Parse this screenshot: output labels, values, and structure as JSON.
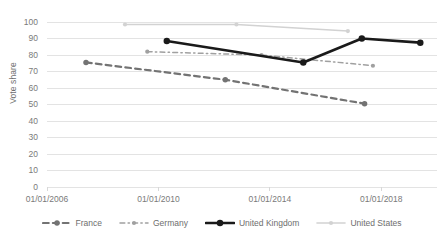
{
  "chart_data": {
    "type": "line",
    "title": "",
    "subtitle": "",
    "xlabel": "",
    "ylabel": "Vote share",
    "ylim": [
      0,
      100
    ],
    "ytick_labels": [
      "100",
      "90",
      "80",
      "70",
      "60",
      "50",
      "40",
      "30",
      "20",
      "10",
      "0"
    ],
    "ytick_values": [
      100,
      90,
      80,
      70,
      60,
      50,
      40,
      30,
      20,
      10,
      0
    ],
    "xtick_labels": [
      "01/01/2006",
      "01/01/2010",
      "01/01/2014",
      "01/01/2018"
    ],
    "xtick_values": [
      2006,
      2010,
      2014,
      2018
    ],
    "xlim": [
      2006,
      2020
    ],
    "grid": "horizontal",
    "legend_position": "bottom",
    "series": [
      {
        "name": "France",
        "color": "#737373",
        "style": "dashed",
        "marker": "circle",
        "width": 2.2,
        "x": [
          2007.4,
          2012.4,
          2017.4
        ],
        "y": [
          75.5,
          65.0,
          50.5
        ]
      },
      {
        "name": "Germany",
        "color": "#a0a0a0",
        "style": "dash-dot",
        "marker": "circle",
        "width": 1.5,
        "x": [
          2009.6,
          2013.7,
          2017.7
        ],
        "y": [
          82.0,
          80.0,
          73.5
        ]
      },
      {
        "name": "United Kingdom",
        "color": "#1a1a1a",
        "style": "solid",
        "marker": "circle",
        "width": 2.6,
        "x": [
          2010.3,
          2015.2,
          2017.3,
          2019.4
        ],
        "y": [
          88.5,
          75.5,
          90.0,
          87.5
        ]
      },
      {
        "name": "United States",
        "color": "#d2d2d2",
        "style": "solid",
        "marker": "circle",
        "width": 1.6,
        "x": [
          2008.8,
          2012.8,
          2016.8
        ],
        "y": [
          98.5,
          98.5,
          94.5
        ]
      }
    ]
  },
  "legend": {
    "items": [
      {
        "label": "France"
      },
      {
        "label": "Germany"
      },
      {
        "label": "United Kingdom"
      },
      {
        "label": "United States"
      }
    ]
  },
  "axes": {
    "y_title": "Vote share"
  },
  "colors": {
    "france": "#737373",
    "germany": "#a0a0a0",
    "united_kingdom": "#1a1a1a",
    "united_states": "#d2d2d2",
    "gridline": "#e3e3e3",
    "text": "#7a7a7a",
    "background": "#ffffff"
  }
}
